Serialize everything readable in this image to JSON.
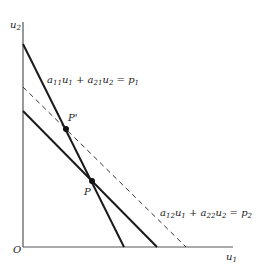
{
  "axes": {
    "x_label": "u",
    "x_label_sub": "1",
    "y_label": "u",
    "y_label_sub": "2",
    "origin_label": "O"
  },
  "lines": [
    {
      "name": "line-1",
      "style": "solid",
      "equation": [
        "a",
        "11",
        "u",
        "1",
        " + ",
        "a",
        "21",
        "u",
        "2",
        " = ",
        "p",
        "1"
      ]
    },
    {
      "name": "line-2",
      "style": "solid"
    },
    {
      "name": "line-dashed",
      "style": "dashed",
      "equation": [
        "a",
        "12",
        "u",
        "1",
        " + ",
        "a",
        "22",
        "u",
        "2",
        " = ",
        "p",
        "2"
      ]
    }
  ],
  "points": [
    {
      "label": "P'"
    },
    {
      "label": "P"
    }
  ],
  "colors": {
    "line": "#1a1a1a",
    "axis": "#555555"
  }
}
